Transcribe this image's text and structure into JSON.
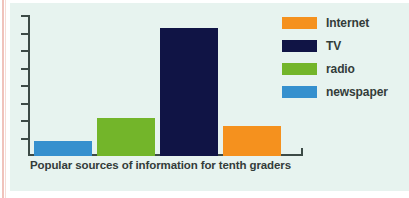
{
  "figure": {
    "background_color": "#e7f3ef",
    "page_rule_color": "#f0c3bc",
    "axis_color": "#3c4a46",
    "caption": "Popular sources of information for tenth graders"
  },
  "legend": {
    "position": "top-right",
    "items": [
      {
        "label": "Internet",
        "color": "#f5911e"
      },
      {
        "label": "TV",
        "color": "#101445"
      },
      {
        "label": "radio",
        "color": "#73b52a"
      },
      {
        "label": "newspaper",
        "color": "#3590ce"
      }
    ]
  },
  "chart_data": {
    "type": "bar",
    "title": "Popular sources of information for tenth graders",
    "xlabel": "",
    "ylabel": "",
    "categories": [
      "newspaper",
      "radio",
      "TV",
      "Internet"
    ],
    "values": [
      2,
      5,
      17,
      4
    ],
    "colors": [
      "#3590ce",
      "#73b52a",
      "#101445",
      "#f5911e"
    ],
    "ylim": [
      0,
      18
    ],
    "y_tick_count": 8,
    "y_tick_labels": [],
    "x_tick_labels": [],
    "grid": false,
    "legend_position": "top-right",
    "series": [
      {
        "name": "tenth graders",
        "values": [
          2,
          5,
          17,
          4
        ]
      }
    ],
    "annotations": []
  }
}
